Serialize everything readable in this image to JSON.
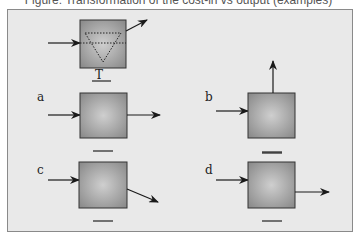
{
  "caption": "Figure: Transformation of the cost-in vs output (examples)",
  "diagram": {
    "reference": {
      "label": "T",
      "description": "Box with input arrow, angled output arrow, dotted inverted triangle inside"
    },
    "panels": [
      {
        "id": "a",
        "label": "a",
        "output": "horizontal right"
      },
      {
        "id": "b",
        "label": "b",
        "output": "vertical up"
      },
      {
        "id": "c",
        "label": "c",
        "output": "diagonal down-right"
      },
      {
        "id": "d",
        "label": "d",
        "output": "horizontal right (lower)"
      }
    ],
    "colors": {
      "box_fill_center": "#c8c8c8",
      "box_fill_edge": "#8f8f8f",
      "background": "#e9e9e9",
      "stroke": "#222222"
    }
  }
}
